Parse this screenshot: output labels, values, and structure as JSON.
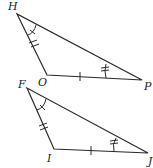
{
  "figure": {
    "triangles": [
      {
        "name": "HOP",
        "vertices": [
          {
            "label": "H",
            "x": 17,
            "y": 14,
            "lx": 8,
            "ly": 10
          },
          {
            "label": "O",
            "x": 47,
            "y": 75,
            "lx": 38,
            "ly": 86
          },
          {
            "label": "P",
            "x": 142,
            "y": 80,
            "lx": 144,
            "ly": 90
          }
        ],
        "side_marks": {
          "HO": 2,
          "OP": 1
        },
        "angle_marks": {
          "H": 1,
          "P": 2
        }
      },
      {
        "name": "FIJ",
        "vertices": [
          {
            "label": "F",
            "x": 27,
            "y": 88,
            "lx": 18,
            "ly": 88
          },
          {
            "label": "I",
            "x": 54,
            "y": 149,
            "lx": 47,
            "ly": 162
          },
          {
            "label": "J",
            "x": 148,
            "y": 153,
            "lx": 148,
            "ly": 165
          }
        ],
        "side_marks": {
          "FI": 2,
          "IJ": 1
        },
        "angle_marks": {
          "F": 1,
          "J": 2
        }
      }
    ]
  }
}
